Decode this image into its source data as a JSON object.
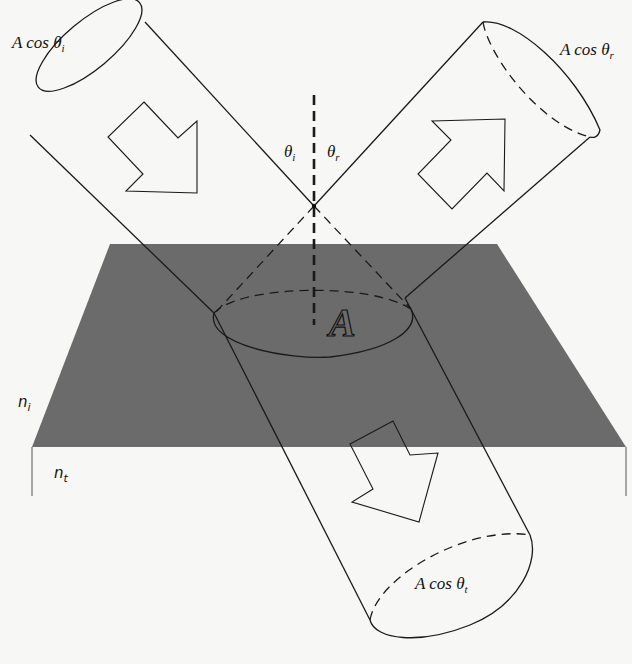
{
  "figure": {
    "type": "reflection-refraction-beam-diagram",
    "colors": {
      "background": "#f7f7f5",
      "interface_surface": "#6b6b6b",
      "line": "#1a1a1a",
      "lower_medium": "#f7f7f5"
    }
  },
  "labels": {
    "incident_area": {
      "prefix": "A cos θ",
      "sub": "i"
    },
    "reflected_area": {
      "prefix": "A cos θ",
      "sub": "r"
    },
    "transmitted_area": {
      "prefix": "A cos θ",
      "sub": "t"
    },
    "theta_i": {
      "symbol": "θ",
      "sub": "i"
    },
    "theta_r": {
      "symbol": "θ",
      "sub": "r"
    },
    "n_i": {
      "symbol": "n",
      "sub": "i"
    },
    "n_t": {
      "symbol": "n",
      "sub": "t"
    },
    "area": "A"
  },
  "beams": [
    {
      "name": "incident",
      "direction": "down-right"
    },
    {
      "name": "reflected",
      "direction": "up-right"
    },
    {
      "name": "transmitted",
      "direction": "down-right"
    }
  ]
}
